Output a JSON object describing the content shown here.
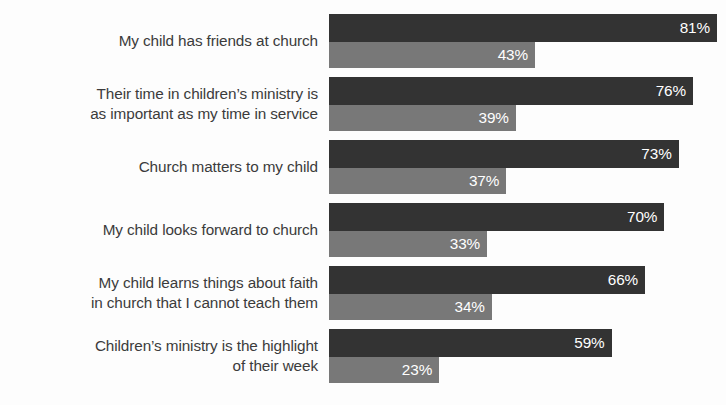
{
  "chart_data": {
    "type": "bar",
    "orientation": "horizontal",
    "title": "",
    "subtitle": "",
    "xlabel": "",
    "ylabel": "",
    "xlim": [
      0,
      100
    ],
    "grid": false,
    "legend": "none",
    "value_suffix": "%",
    "categories": [
      "My child has friends at church",
      "Their time in children’s ministry is\nas important as my time in service",
      "Church matters to my child",
      "My child looks forward to church",
      "My child learns things about faith\nin church that I cannot teach them",
      "Children’s ministry is the highlight\nof their week"
    ],
    "series": [
      {
        "name": "primary",
        "color": "#333333",
        "values": [
          81,
          76,
          73,
          70,
          66,
          59
        ],
        "labels": [
          "81%",
          "76%",
          "73%",
          "70%",
          "66%",
          "59%"
        ]
      },
      {
        "name": "secondary",
        "color": "#787878",
        "values": [
          43,
          39,
          37,
          33,
          34,
          23
        ],
        "labels": [
          "43%",
          "39%",
          "37%",
          "33%",
          "34%",
          "23%"
        ]
      }
    ]
  },
  "layout": {
    "background": "#fdfdfd",
    "label_color": "#3b3b3b",
    "value_color": "#ffffff",
    "plot_left_px": 329,
    "px_per_percent": 4.79,
    "group_top_px": [
      14,
      77,
      140,
      203,
      266,
      329
    ],
    "group_pitch_px": 63
  }
}
